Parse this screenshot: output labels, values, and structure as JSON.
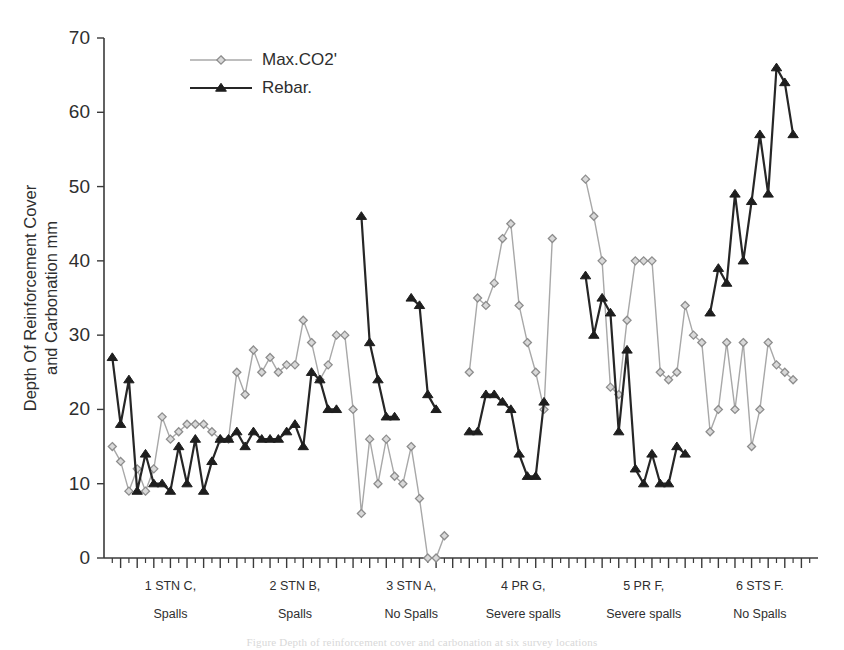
{
  "chart_data": {
    "type": "line",
    "title": "",
    "xlabel": "",
    "ylabel": "Depth Of Reinforcement Cover and Carbonation mm",
    "ylabel_line1": "Depth Of Reinforcement Cover",
    "ylabel_line2": "and Carbonation mm",
    "ylim": [
      0,
      70
    ],
    "ytick_values": [
      0,
      10,
      20,
      30,
      40,
      50,
      60,
      70
    ],
    "ytick_labels": [
      "0",
      "10",
      "20",
      "30",
      "40",
      "50",
      "60",
      "70"
    ],
    "grid": false,
    "legend_position": "top-left-inside",
    "legend": [
      {
        "name": "Max.CO2'",
        "marker": "diamond",
        "color": "#a8a8a8"
      },
      {
        "name": "Rebar.",
        "marker": "triangle",
        "color": "#262626"
      }
    ],
    "x_groups": [
      {
        "id": 1,
        "line1": "1 STN C,",
        "line2": "Spalls",
        "start_index": 0,
        "count": 15
      },
      {
        "id": 2,
        "line1": "2 STN B,",
        "line2": "Spalls",
        "start_index": 15,
        "count": 15
      },
      {
        "id": 3,
        "line1": "3 STN A,",
        "line2": "No Spalls",
        "start_index": 30,
        "count": 13
      },
      {
        "id": 4,
        "line1": "4 PR G,",
        "line2": "Severe spalls",
        "start_index": 43,
        "count": 14
      },
      {
        "id": 5,
        "line1": "5 PR F,",
        "line2": "Severe spalls",
        "start_index": 57,
        "count": 15
      },
      {
        "id": 6,
        "line1": "6 STS F.",
        "line2": "No Spalls",
        "start_index": 72,
        "count": 13
      }
    ],
    "series": [
      {
        "name": "Max.CO2'",
        "values": [
          15,
          13,
          9,
          12,
          9,
          12,
          19,
          16,
          17,
          18,
          18,
          18,
          17,
          16,
          16,
          25,
          22,
          28,
          25,
          27,
          25,
          26,
          26,
          32,
          29,
          24,
          26,
          30,
          30,
          20,
          6,
          16,
          10,
          16,
          11,
          10,
          15,
          8,
          0,
          0,
          3,
          null,
          null,
          25,
          35,
          34,
          37,
          43,
          45,
          34,
          29,
          25,
          20,
          43,
          null,
          null,
          null,
          51,
          46,
          40,
          23,
          22,
          32,
          40,
          40,
          40,
          25,
          24,
          25,
          34,
          30,
          29,
          17,
          20,
          29,
          20,
          29,
          15,
          20,
          29,
          26,
          25,
          24,
          null,
          null
        ]
      },
      {
        "name": "Rebar.",
        "values": [
          27,
          18,
          24,
          9,
          14,
          10,
          10,
          9,
          15,
          10,
          16,
          9,
          13,
          16,
          16,
          17,
          15,
          17,
          16,
          16,
          16,
          17,
          18,
          15,
          25,
          24,
          20,
          20,
          null,
          null,
          46,
          29,
          24,
          19,
          19,
          null,
          35,
          34,
          22,
          20,
          null,
          null,
          null,
          17,
          17,
          22,
          22,
          21,
          20,
          14,
          11,
          11,
          21,
          null,
          null,
          null,
          null,
          38,
          30,
          35,
          33,
          17,
          28,
          12,
          10,
          14,
          10,
          10,
          15,
          14,
          null,
          null,
          33,
          39,
          37,
          49,
          40,
          48,
          57,
          49,
          66,
          64,
          57,
          null,
          null
        ]
      }
    ]
  },
  "caption": {
    "text": "Figure  Depth of reinforcement cover and carbonation at six survey locations"
  }
}
